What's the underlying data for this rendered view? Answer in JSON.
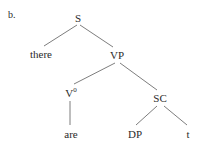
{
  "figure": {
    "enumeration": "b.",
    "caption": "",
    "background_color": "#ffffff",
    "text_color": "#2b2b2b",
    "branch_color": "#6e6e6e"
  },
  "tree": {
    "nodes": [
      {
        "id": "s",
        "label": "S",
        "superscript": "",
        "type": "nonterminal",
        "x": 78,
        "y": 13
      },
      {
        "id": "there",
        "label": "there",
        "superscript": "",
        "type": "terminal",
        "x": 41,
        "y": 49
      },
      {
        "id": "vp",
        "label": "VP",
        "superscript": "",
        "type": "nonterminal",
        "x": 117,
        "y": 50
      },
      {
        "id": "v0",
        "label": "V",
        "superscript": "0",
        "type": "nonterminal",
        "x": 71,
        "y": 87
      },
      {
        "id": "are",
        "label": "are",
        "superscript": "",
        "type": "terminal",
        "x": 71,
        "y": 129
      },
      {
        "id": "sc",
        "label": "SC",
        "superscript": "",
        "type": "nonterminal",
        "x": 160,
        "y": 93
      },
      {
        "id": "dp",
        "label": "DP",
        "superscript": "",
        "type": "terminal",
        "x": 135,
        "y": 129
      },
      {
        "id": "t",
        "label": "t",
        "superscript": "",
        "type": "terminal",
        "x": 188,
        "y": 129
      }
    ],
    "edges": [
      {
        "id": "s-there",
        "from": "s",
        "to": "there",
        "x1": 77,
        "y1": 25,
        "x2": 44,
        "y2": 46
      },
      {
        "id": "s-vp",
        "from": "s",
        "to": "vp",
        "x1": 80,
        "y1": 25,
        "x2": 113,
        "y2": 47
      },
      {
        "id": "vp-v0",
        "from": "vp",
        "to": "v0",
        "x1": 115,
        "y1": 63,
        "x2": 74,
        "y2": 84
      },
      {
        "id": "vp-sc",
        "from": "vp",
        "to": "sc",
        "x1": 120,
        "y1": 63,
        "x2": 157,
        "y2": 90
      },
      {
        "id": "v0-are",
        "from": "v0",
        "to": "are",
        "x1": 70,
        "y1": 101,
        "x2": 70,
        "y2": 125
      },
      {
        "id": "sc-dp",
        "from": "sc",
        "to": "dp",
        "x1": 157,
        "y1": 106,
        "x2": 136,
        "y2": 125
      },
      {
        "id": "sc-t",
        "from": "sc",
        "to": "t",
        "x1": 164,
        "y1": 106,
        "x2": 187,
        "y2": 125
      }
    ]
  }
}
